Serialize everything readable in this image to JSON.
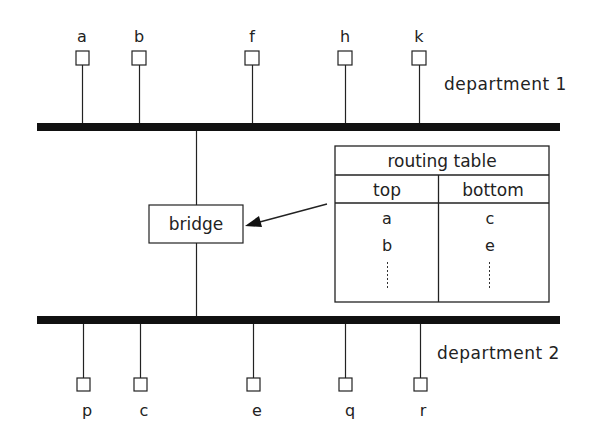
{
  "diagram": {
    "top_segment": {
      "label": "department 1",
      "nodes": [
        {
          "label": "a",
          "x": 82
        },
        {
          "label": "b",
          "x": 139
        },
        {
          "label": "f",
          "x": 252
        },
        {
          "label": "h",
          "x": 345
        },
        {
          "label": "k",
          "x": 419
        }
      ]
    },
    "bottom_segment": {
      "label": "department 2",
      "nodes": [
        {
          "label": "p",
          "x": 83
        },
        {
          "label": "c",
          "x": 140
        },
        {
          "label": "e",
          "x": 253
        },
        {
          "label": "q",
          "x": 345
        },
        {
          "label": "r",
          "x": 420
        }
      ]
    },
    "bridge": {
      "label": "bridge"
    },
    "routing_table": {
      "title": "routing table",
      "columns": [
        "top",
        "bottom"
      ],
      "rows": [
        [
          "a",
          "c"
        ],
        [
          "b",
          "e"
        ]
      ],
      "continuation": "⋮"
    },
    "colors": {
      "line": "#1a1a1a",
      "bus": "#111111",
      "background": "#ffffff"
    }
  }
}
